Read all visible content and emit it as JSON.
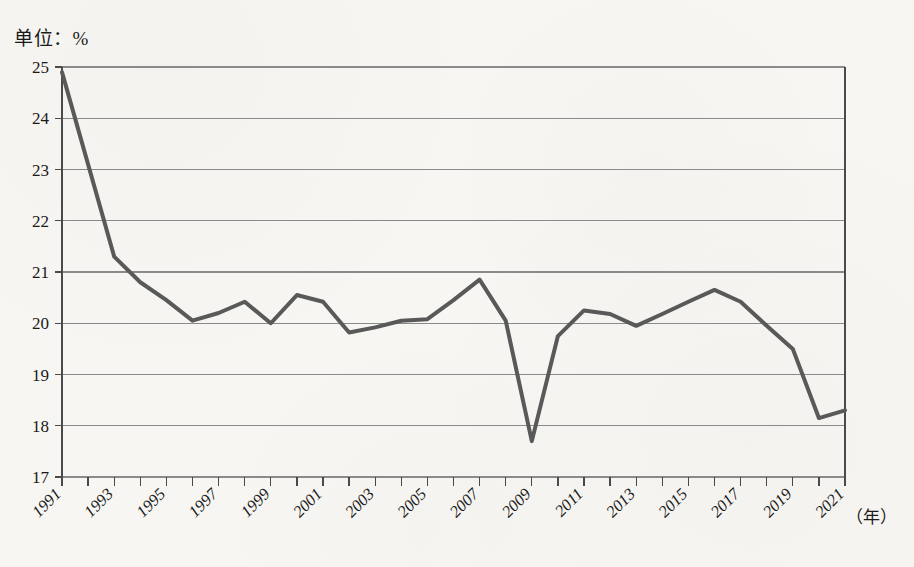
{
  "figure": {
    "unit_label": "单位：%",
    "x_axis_unit": "（年）"
  },
  "chart_data": {
    "type": "line",
    "title": "",
    "subtitle": "",
    "xlabel": "（年）",
    "ylabel": "单位：%",
    "ylim": [
      17,
      25
    ],
    "ytick_step": 1,
    "yticks": [
      "17",
      "18",
      "19",
      "20",
      "21",
      "22",
      "23",
      "24",
      "25"
    ],
    "grid": true,
    "grid_axis": "y",
    "legend": false,
    "legend_position": "none",
    "xlim": [
      1991,
      2021
    ],
    "xtick_step": 1,
    "xlabel_step": 2,
    "x": [
      1991,
      1992,
      1993,
      1994,
      1995,
      1996,
      1997,
      1998,
      1999,
      2000,
      2001,
      2002,
      2003,
      2004,
      2005,
      2006,
      2007,
      2008,
      2009,
      2010,
      2011,
      2012,
      2013,
      2014,
      2015,
      2016,
      2017,
      2018,
      2019,
      2020,
      2021
    ],
    "xticklabels": [
      "1991",
      "",
      "1993",
      "",
      "1995",
      "",
      "1997",
      "",
      "1999",
      "",
      "2001",
      "",
      "2003",
      "",
      "2005",
      "",
      "2007",
      "",
      "2009",
      "",
      "2011",
      "",
      "2013",
      "",
      "2015",
      "",
      "2017",
      "",
      "2019",
      "",
      "2021"
    ],
    "values": [
      24.9,
      23.1,
      21.3,
      20.8,
      20.45,
      20.05,
      20.2,
      20.42,
      20.0,
      20.55,
      20.42,
      19.82,
      19.92,
      20.05,
      20.08,
      20.45,
      20.85,
      20.05,
      17.7,
      19.75,
      20.25,
      20.18,
      19.95,
      20.18,
      20.42,
      20.65,
      20.42,
      19.95,
      19.5,
      18.15,
      18.3
    ],
    "series": [
      {
        "name": "",
        "color": "#595959",
        "line_width": 4,
        "values": [
          24.9,
          23.1,
          21.3,
          20.8,
          20.45,
          20.05,
          20.2,
          20.42,
          20.0,
          20.55,
          20.42,
          19.82,
          19.92,
          20.05,
          20.08,
          20.45,
          20.85,
          20.05,
          17.7,
          19.75,
          20.25,
          20.18,
          19.95,
          20.18,
          20.42,
          20.65,
          20.42,
          19.95,
          19.5,
          18.15,
          18.3
        ]
      }
    ],
    "colors": {
      "line": "#595959",
      "grid": "#8a8a8a",
      "axis": "#4a4a4a",
      "background": "#f7f6f2",
      "text": "#1a1a1a"
    }
  }
}
